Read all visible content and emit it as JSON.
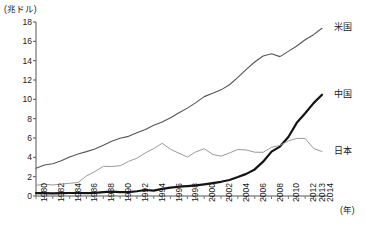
{
  "chart_data": {
    "type": "line",
    "title": "",
    "ylabel": "(兆ドル)",
    "xlabel": "(年)",
    "ylim": [
      0,
      18
    ],
    "yticks": [
      0,
      2,
      4,
      6,
      8,
      10,
      12,
      14,
      16,
      18
    ],
    "grid": false,
    "legend_position": "right-inline",
    "x": [
      1980,
      1981,
      1982,
      1983,
      1984,
      1985,
      1986,
      1987,
      1988,
      1989,
      1990,
      1991,
      1992,
      1993,
      1994,
      1995,
      1996,
      1997,
      1998,
      1999,
      2000,
      2001,
      2002,
      2003,
      2004,
      2005,
      2006,
      2007,
      2008,
      2009,
      2010,
      2011,
      2012,
      2013,
      2014
    ],
    "xtick_labels": [
      "1980",
      "1982",
      "1984",
      "1986",
      "1988",
      "1990",
      "1992",
      "1994",
      "1996",
      "1998",
      "2000",
      "2002",
      "2004",
      "2006",
      "2008",
      "2010",
      "2012",
      "2013",
      "2014"
    ],
    "series": [
      {
        "name": "米国",
        "label": "米国",
        "color": "#555555",
        "width": 1.1,
        "values": [
          2.86,
          3.21,
          3.34,
          3.64,
          4.04,
          4.35,
          4.59,
          4.87,
          5.25,
          5.66,
          5.98,
          6.17,
          6.54,
          6.88,
          7.31,
          7.66,
          8.1,
          8.61,
          9.09,
          9.66,
          10.28,
          10.62,
          10.98,
          11.51,
          12.27,
          13.09,
          13.86,
          14.48,
          14.72,
          14.42,
          14.96,
          15.52,
          16.16,
          16.69,
          17.35
        ]
      },
      {
        "name": "中国",
        "label": "中国",
        "color": "#141414",
        "width": 2.2,
        "values": [
          0.3,
          0.29,
          0.28,
          0.3,
          0.31,
          0.31,
          0.3,
          0.33,
          0.41,
          0.46,
          0.4,
          0.41,
          0.49,
          0.62,
          0.56,
          0.73,
          0.86,
          0.96,
          1.03,
          1.09,
          1.21,
          1.34,
          1.47,
          1.66,
          1.96,
          2.29,
          2.75,
          3.55,
          4.59,
          5.11,
          6.1,
          7.57,
          8.56,
          9.61,
          10.48
        ]
      },
      {
        "name": "日本",
        "label": "日本",
        "color": "#9a9a9a",
        "width": 1.0,
        "values": [
          1.1,
          1.22,
          1.14,
          1.24,
          1.31,
          1.4,
          2.07,
          2.53,
          3.07,
          3.05,
          3.13,
          3.58,
          3.91,
          4.45,
          4.91,
          5.45,
          4.83,
          4.42,
          4.03,
          4.56,
          4.89,
          4.3,
          4.12,
          4.45,
          4.82,
          4.76,
          4.53,
          4.52,
          5.04,
          5.23,
          5.7,
          5.96,
          5.95,
          4.92,
          4.6
        ]
      }
    ],
    "axis_geometry": {
      "plot_left": 36,
      "plot_right": 322,
      "plot_top": 22,
      "plot_bottom": 196
    }
  }
}
